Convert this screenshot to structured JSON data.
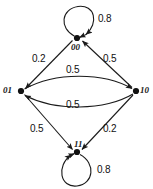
{
  "diagram": {
    "type": "markov-chain-state-diagram",
    "stroke_color": "#1a1a1a",
    "node_color": "#111111",
    "background_color": "#ffffff",
    "nodes": [
      {
        "id": "00",
        "label": "00",
        "x": 77,
        "y": 38,
        "label_x": 71,
        "label_y": 43
      },
      {
        "id": "01",
        "label": "01",
        "x": 21,
        "y": 91,
        "label_x": 3,
        "label_y": 87
      },
      {
        "id": "10",
        "label": "10",
        "x": 136,
        "y": 91,
        "label_x": 140,
        "label_y": 87
      },
      {
        "id": "11",
        "label": "11",
        "x": 77,
        "y": 152,
        "label_x": 73,
        "label_y": 140
      }
    ],
    "edges": [
      {
        "from": "00",
        "to": "00",
        "label": "0.8",
        "kind": "self-loop-top",
        "label_x": 98,
        "label_y": 15
      },
      {
        "from": "00",
        "to": "01",
        "label": "0.2",
        "kind": "straight",
        "label_x": 33,
        "label_y": 55
      },
      {
        "from": "10",
        "to": "00",
        "label": "0.5",
        "kind": "straight",
        "label_x": 104,
        "label_y": 55
      },
      {
        "from": "01",
        "to": "10",
        "label": "0.5",
        "kind": "curve-upper",
        "label_x": 66,
        "label_y": 66
      },
      {
        "from": "10",
        "to": "01",
        "label": "0.5",
        "kind": "curve-lower",
        "label_x": 66,
        "label_y": 101
      },
      {
        "from": "01",
        "to": "11",
        "label": "0.5",
        "kind": "straight",
        "label_x": 31,
        "label_y": 125
      },
      {
        "from": "10",
        "to": "11",
        "label": "0.2",
        "kind": "straight",
        "label_x": 104,
        "label_y": 125
      },
      {
        "from": "11",
        "to": "11",
        "label": "0.8",
        "kind": "self-loop-bottom",
        "label_x": 97,
        "label_y": 166
      }
    ]
  }
}
